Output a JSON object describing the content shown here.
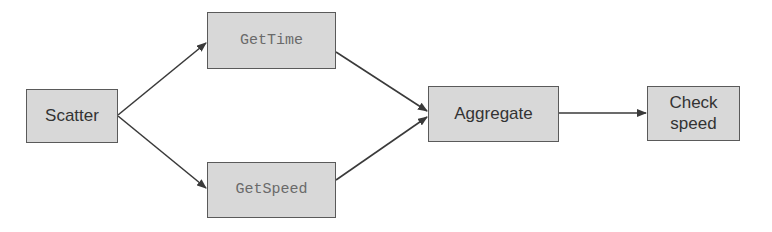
{
  "diagram": {
    "type": "flowchart",
    "colors": {
      "node_fill": "#d8d8d8",
      "node_border": "#5a5a5a",
      "edge": "#3a3a3a",
      "text_sans": "#333333",
      "text_mono": "#6a6a6a"
    },
    "nodes": [
      {
        "id": "scatter",
        "label": "Scatter",
        "style": "sans"
      },
      {
        "id": "gettime",
        "label": "GetTime",
        "style": "mono"
      },
      {
        "id": "getspeed",
        "label": "GetSpeed",
        "style": "mono"
      },
      {
        "id": "aggregate",
        "label": "Aggregate",
        "style": "sans"
      },
      {
        "id": "checkspeed",
        "label": "Check speed",
        "label_lines": [
          "Check",
          "speed"
        ],
        "style": "sans"
      }
    ],
    "edges": [
      {
        "from": "scatter",
        "to": "gettime"
      },
      {
        "from": "scatter",
        "to": "getspeed"
      },
      {
        "from": "gettime",
        "to": "aggregate"
      },
      {
        "from": "getspeed",
        "to": "aggregate"
      },
      {
        "from": "aggregate",
        "to": "checkspeed"
      }
    ]
  }
}
